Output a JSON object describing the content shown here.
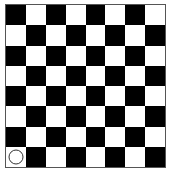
{
  "game": {
    "type": "checkerboard",
    "rows": 8,
    "cols": 8,
    "top_left_color": "dark",
    "colors": {
      "dark": "#000000",
      "light": "#ffffff",
      "border": "#555555"
    },
    "pieces": [
      {
        "row": 7,
        "col": 0,
        "shape": "circle",
        "fill": "#ffffff",
        "outline": "#333333"
      }
    ]
  }
}
